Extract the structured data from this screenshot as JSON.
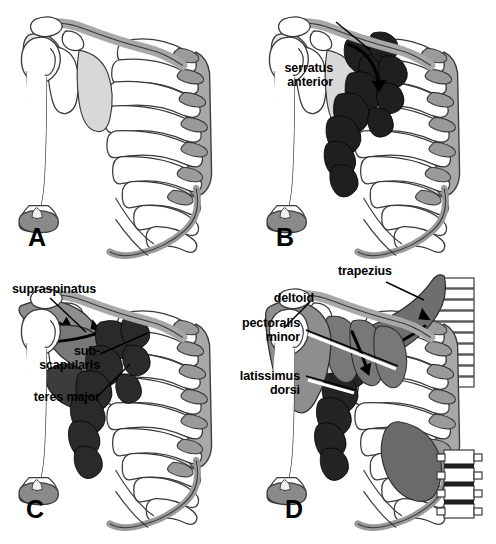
{
  "figure": {
    "background_color": "#ffffff",
    "width": 496,
    "height": 544
  },
  "palette": {
    "bone_fill": "#ffffff",
    "bone_outline": "#3a3a3a",
    "cartilage_gray": "#9a9a9a",
    "clavicle_gray": "#a8a8a8",
    "muscle_dark": "#1f1f1f",
    "muscle_mid": "#5c5c5c",
    "muscle_light": "#8e8e8e",
    "leader_line": "#000000",
    "text": "#000000"
  },
  "panels": [
    {
      "id": "A",
      "letter": "A",
      "caption": "bare skeleton",
      "labels": []
    },
    {
      "id": "B",
      "letter": "B",
      "caption": "serratus anterior added",
      "labels": [
        {
          "name": "serratus-anterior",
          "lines": [
            "serratus",
            "anterior"
          ],
          "align": "right"
        }
      ]
    },
    {
      "id": "C",
      "letter": "C",
      "caption": "rotator cuff and teres major added",
      "labels": [
        {
          "name": "supraspinatus",
          "lines": [
            "supraspinatus"
          ],
          "align": "left"
        },
        {
          "name": "subscapularis",
          "lines": [
            "sub-",
            "scapularis"
          ],
          "align": "right"
        },
        {
          "name": "teres-major",
          "lines": [
            "teres major"
          ],
          "align": "right"
        }
      ]
    },
    {
      "id": "D",
      "letter": "D",
      "caption": "superficial layer added",
      "labels": [
        {
          "name": "trapezius",
          "lines": [
            "trapezius"
          ],
          "align": "left"
        },
        {
          "name": "deltoid",
          "lines": [
            "deltoid"
          ],
          "align": "right"
        },
        {
          "name": "pectoralis-minor",
          "lines": [
            "pectoralis",
            "minor"
          ],
          "align": "right"
        },
        {
          "name": "latissimus-dorsi",
          "lines": [
            "latissimus",
            "dorsi"
          ],
          "align": "right"
        }
      ]
    }
  ],
  "callouts": {
    "serratus_anterior": "serratus\nanterior",
    "supraspinatus": "supraspinatus",
    "subscapularis": "sub-\nscapularis",
    "teres_major": "teres major",
    "trapezius": "trapezius",
    "deltoid": "deltoid",
    "pectoralis_minor": "pectoralis\nminor",
    "latissimus_dorsi": "latissimus\ndorsi"
  },
  "letters": {
    "a": "A",
    "b": "B",
    "c": "C",
    "d": "D"
  },
  "anatomy": {
    "bones": [
      "clavicle",
      "scapula",
      "humerus",
      "ribs",
      "costal cartilage",
      "sternum",
      "thoracic vertebrae",
      "lumbar vertebrae"
    ],
    "muscles_by_panel": {
      "A": [],
      "B": [
        "serratus anterior"
      ],
      "C": [
        "supraspinatus",
        "subscapularis",
        "teres major",
        "serratus anterior"
      ],
      "D": [
        "trapezius",
        "deltoid",
        "pectoralis minor",
        "latissimus dorsi",
        "serratus anterior"
      ]
    },
    "rib_count": 10
  }
}
